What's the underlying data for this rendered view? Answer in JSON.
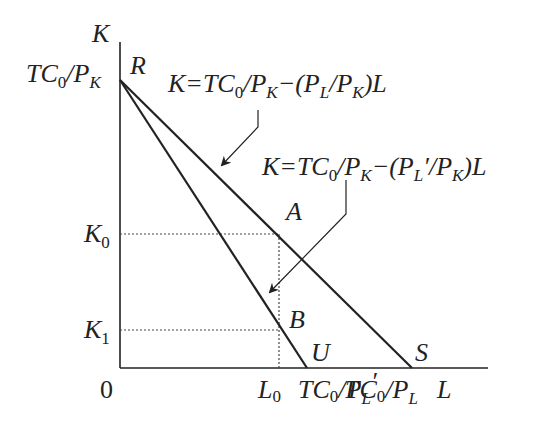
{
  "axes": {
    "y_label": "K",
    "x_label": "L",
    "origin": "0"
  },
  "y_ticks": {
    "intercept": {
      "main": "TC",
      "sub": "0",
      "mid": "/P",
      "sub2": "K"
    },
    "k0": {
      "main": "K",
      "sub": "0"
    },
    "k1": {
      "main": "K",
      "sub": "1"
    }
  },
  "x_ticks": {
    "l0": {
      "main": "L",
      "sub": "0"
    },
    "u_intercept": {
      "main": "TC",
      "sub": "0",
      "mid": "/P",
      "sub2": "L",
      "prime": "′"
    },
    "s_intercept": {
      "main": "TC",
      "sub": "0",
      "mid": "/P",
      "sub2": "L"
    }
  },
  "points": {
    "R": "R",
    "A": "A",
    "B": "B",
    "U": "U",
    "S": "S"
  },
  "equations": {
    "original": {
      "a": "K=TC",
      "sub0": "0",
      "b": "/P",
      "subK": "K",
      "c": "−(P",
      "subL": "L",
      "d": "/P",
      "subK2": "K",
      "e": ")L"
    },
    "new": {
      "a": "K=TC",
      "sub0": "0",
      "b": "/P",
      "subK": "K",
      "c": "−(P",
      "subL": "L",
      "prime": "′",
      "d": "/P",
      "subK2": "K",
      "e": ")L"
    }
  },
  "colors": {
    "line": "#222222",
    "dotted": "#444444"
  }
}
